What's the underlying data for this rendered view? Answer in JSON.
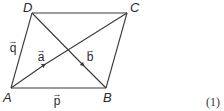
{
  "diagram": {
    "type": "parallelogram-vectors",
    "colors": {
      "line": "#3a3a3a",
      "text": "#2a2a2a",
      "background": "#ffffff"
    },
    "vertices": [
      {
        "id": "A",
        "label": "A",
        "x": 11,
        "y": 88
      },
      {
        "id": "B",
        "label": "B",
        "x": 106,
        "y": 88
      },
      {
        "id": "C",
        "label": "C",
        "x": 127,
        "y": 13
      },
      {
        "id": "D",
        "label": "D",
        "x": 32,
        "y": 13
      }
    ],
    "edges": [
      {
        "from": "A",
        "to": "B"
      },
      {
        "from": "B",
        "to": "C"
      },
      {
        "from": "C",
        "to": "D"
      },
      {
        "from": "D",
        "to": "A"
      },
      {
        "from": "A",
        "to": "C",
        "arrow": true
      },
      {
        "from": "D",
        "to": "B",
        "arrow": true
      }
    ],
    "vectors": {
      "p": {
        "arrow": "→",
        "letter": "p"
      },
      "q": {
        "arrow": "→",
        "letter": "q"
      },
      "a": {
        "arrow": "→",
        "letter": "a"
      },
      "b": {
        "arrow": "→",
        "letter": "b"
      }
    },
    "equation_number": "(1)"
  }
}
